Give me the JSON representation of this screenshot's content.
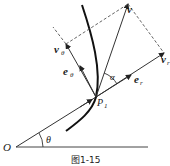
{
  "diagram": {
    "type": "kinematics-polar-velocity-decomposition",
    "labels": {
      "origin": "O",
      "theta": "θ",
      "point": "P",
      "point_sub": "1",
      "alpha": "α",
      "v": "v",
      "v_r": "v",
      "v_r_sub": "r",
      "v_theta": "v",
      "v_theta_sub": "θ",
      "e_r": "e",
      "e_r_sub": "r",
      "e_theta": "e",
      "e_theta_sub": "θ"
    },
    "caption": "图1-15",
    "colors": {
      "line": "#333333",
      "curve": "#111111",
      "dashed": "#555555"
    }
  }
}
